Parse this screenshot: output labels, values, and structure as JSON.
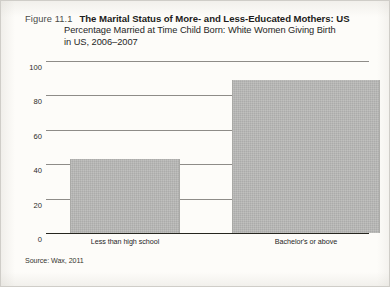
{
  "figure": {
    "number_label": "Figure 11.1",
    "title": "The Marital Status of More- and Less-Educated Mothers: US",
    "subtitle_line1": "Percentage Married at Time Child Born: White Women Giving Birth",
    "subtitle_line2": "in US, 2006–2007",
    "source": "Source: Wax, 2011"
  },
  "colors": {
    "bar_fill": "#b9b9b7",
    "gridline": "#8e8c88",
    "axis": "#26261f",
    "page": "#fdfcf9",
    "text": "#1d1d1b"
  },
  "chart_data": {
    "type": "bar",
    "title": "The Marital Status of More- and Less-Educated Mothers: US",
    "subtitle": "Percentage Married at Time Child Born: White Women Giving Birth in US, 2006–2007",
    "xlabel": "",
    "ylabel": "",
    "categories": [
      "Less than high school",
      "Bachelor's or above"
    ],
    "values": [
      43,
      89
    ],
    "ylim": [
      0,
      100
    ],
    "yticks": [
      0,
      20,
      40,
      60,
      80,
      100
    ],
    "ytick_labels": [
      "0",
      "20",
      "40",
      "60",
      "80",
      "100"
    ],
    "grid": true,
    "legend": "none",
    "series": [
      {
        "name": "Percentage married at time child born",
        "values": [
          43,
          89
        ]
      }
    ]
  }
}
